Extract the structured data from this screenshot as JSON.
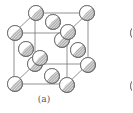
{
  "figure": {
    "caption": "(a)",
    "colors": {
      "edge": "#777777",
      "atom_outline": "#6a6a6a",
      "hatch": "#7a7a7a",
      "highlight": "#ffffff"
    },
    "atom_radius": 7.5,
    "cube": {
      "front": {
        "x1": 14,
        "y1": 33,
        "x2": 67,
        "y2": 84
      },
      "back": {
        "x1": 35,
        "y1": 13,
        "x2": 88,
        "y2": 64
      }
    },
    "atoms": [
      {
        "name": "corner-bottom-back-left",
        "x": 35,
        "y": 64
      },
      {
        "name": "back-face-center",
        "x": 62,
        "y": 40
      },
      {
        "name": "corner-top-back-left",
        "x": 36,
        "y": 13
      },
      {
        "name": "corner-top-back-right",
        "x": 87,
        "y": 13
      },
      {
        "name": "top-face-center",
        "x": 53,
        "y": 22
      },
      {
        "name": "left-face-center",
        "x": 26,
        "y": 49
      },
      {
        "name": "right-face-center",
        "x": 78,
        "y": 50
      },
      {
        "name": "corner-bottom-back-right",
        "x": 88,
        "y": 65
      },
      {
        "name": "bottom-face-center",
        "x": 52,
        "y": 76
      },
      {
        "name": "front-face-center",
        "x": 40,
        "y": 58
      },
      {
        "name": "corner-top-front-left",
        "x": 15,
        "y": 33
      },
      {
        "name": "corner-top-front-right",
        "x": 68,
        "y": 32
      },
      {
        "name": "corner-bottom-front-left",
        "x": 15,
        "y": 84
      },
      {
        "name": "corner-bottom-front-right",
        "x": 67,
        "y": 85
      }
    ],
    "partial_atoms_right_edge": [
      {
        "name": "next-figure-atom-1",
        "x": 138,
        "y": 33
      },
      {
        "name": "next-figure-atom-2",
        "x": 138,
        "y": 86
      }
    ]
  }
}
